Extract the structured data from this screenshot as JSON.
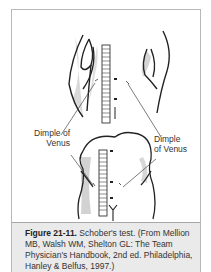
{
  "figure": {
    "number_label": "Figure 21-11.",
    "caption_text": " Schober's test. (From Mellion MB, Walsh WM, Shelton GL: The Team Physician's Handbook, 2nd ed. Philadelphia, Hanley & Belfus, 1997.)"
  },
  "illustration": {
    "label_left": "Dimple of Venus",
    "label_left_line1": "Dimple of",
    "label_left_line2": "Venus",
    "label_right_line1": "Dimple",
    "label_right_line2": "of Venus",
    "ruler_top_marks": [
      "0",
      "10",
      "15"
    ],
    "ruler_bottom_marks": [
      "0",
      "10",
      "20"
    ]
  },
  "colors": {
    "frame_border": "#b8b8b8",
    "caption_bg": "#eaeaea",
    "line": "#222222",
    "shade": "#c8c8c8"
  }
}
